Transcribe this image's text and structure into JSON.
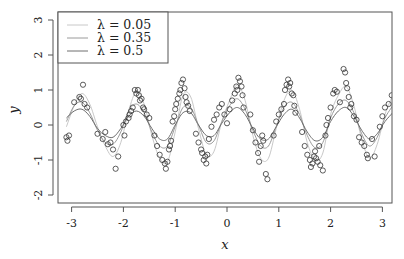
{
  "chart_data": {
    "type": "scatter",
    "title": "",
    "xlabel": "x",
    "ylabel": "y",
    "xlim": [
      -3.25,
      3.2
    ],
    "ylim": [
      -2.2,
      3.2
    ],
    "xticks": [
      -3,
      -2,
      -1,
      0,
      1,
      2,
      3
    ],
    "yticks": [
      -2,
      -1,
      0,
      1,
      2,
      3
    ],
    "grid": false,
    "legend_position": "top-left",
    "legend": [
      {
        "label": "λ = 0.05",
        "color": "#c8c8c8"
      },
      {
        "label": "λ = 0.35",
        "color": "#9a9a9a"
      },
      {
        "label": "λ = 0.5",
        "color": "#6e6e6e"
      }
    ],
    "points": [
      [
        -3.1,
        -0.35
      ],
      [
        -3.08,
        -0.45
      ],
      [
        -3.05,
        -0.3
      ],
      [
        -2.95,
        0.65
      ],
      [
        -2.85,
        0.8
      ],
      [
        -2.82,
        0.75
      ],
      [
        -2.78,
        1.15
      ],
      [
        -2.75,
        0.6
      ],
      [
        -2.7,
        0.5
      ],
      [
        -2.5,
        -0.25
      ],
      [
        -2.4,
        -0.4
      ],
      [
        -2.35,
        -0.2
      ],
      [
        -2.3,
        -0.55
      ],
      [
        -2.25,
        -0.5
      ],
      [
        -2.2,
        -0.7
      ],
      [
        -2.15,
        -1.25
      ],
      [
        -2.1,
        -0.9
      ],
      [
        -2.0,
        0.0
      ],
      [
        -1.98,
        -0.3
      ],
      [
        -1.95,
        0.1
      ],
      [
        -1.9,
        0.2
      ],
      [
        -1.88,
        0.3
      ],
      [
        -1.85,
        0.4
      ],
      [
        -1.82,
        0.5
      ],
      [
        -1.78,
        1.0
      ],
      [
        -1.75,
        0.9
      ],
      [
        -1.72,
        1.0
      ],
      [
        -1.7,
        0.85
      ],
      [
        -1.68,
        0.7
      ],
      [
        -1.65,
        0.75
      ],
      [
        -1.62,
        0.5
      ],
      [
        -1.6,
        0.45
      ],
      [
        -1.55,
        0.3
      ],
      [
        -1.5,
        0.2
      ],
      [
        -1.4,
        -0.3
      ],
      [
        -1.35,
        -0.6
      ],
      [
        -1.3,
        -0.85
      ],
      [
        -1.25,
        -1.0
      ],
      [
        -1.2,
        -1.1
      ],
      [
        -1.18,
        -1.25
      ],
      [
        -1.15,
        -1.05
      ],
      [
        -1.12,
        -0.7
      ],
      [
        -1.1,
        -0.6
      ],
      [
        -1.08,
        -0.45
      ],
      [
        -1.05,
        0.1
      ],
      [
        -1.02,
        0.25
      ],
      [
        -1.0,
        0.45
      ],
      [
        -0.98,
        0.6
      ],
      [
        -0.95,
        0.75
      ],
      [
        -0.92,
        0.9
      ],
      [
        -0.9,
        1.0
      ],
      [
        -0.88,
        1.2
      ],
      [
        -0.85,
        1.3
      ],
      [
        -0.82,
        1.05
      ],
      [
        -0.8,
        0.8
      ],
      [
        -0.78,
        0.65
      ],
      [
        -0.75,
        0.55
      ],
      [
        -0.72,
        0.4
      ],
      [
        -0.6,
        -0.25
      ],
      [
        -0.55,
        -0.5
      ],
      [
        -0.5,
        -0.7
      ],
      [
        -0.48,
        -0.8
      ],
      [
        -0.45,
        -1.0
      ],
      [
        -0.42,
        -0.9
      ],
      [
        -0.4,
        -1.1
      ],
      [
        -0.38,
        -0.85
      ],
      [
        -0.35,
        -0.4
      ],
      [
        -0.3,
        -0.05
      ],
      [
        -0.25,
        0.15
      ],
      [
        -0.2,
        0.3
      ],
      [
        -0.15,
        0.5
      ],
      [
        -0.1,
        0.6
      ],
      [
        -0.05,
        0.3
      ],
      [
        0.0,
        0.05
      ],
      [
        0.05,
        0.45
      ],
      [
        0.1,
        0.7
      ],
      [
        0.15,
        0.9
      ],
      [
        0.18,
        1.1
      ],
      [
        0.2,
        1.0
      ],
      [
        0.22,
        1.35
      ],
      [
        0.25,
        1.25
      ],
      [
        0.28,
        1.1
      ],
      [
        0.3,
        0.85
      ],
      [
        0.32,
        0.5
      ],
      [
        0.45,
        0.3
      ],
      [
        0.5,
        -0.15
      ],
      [
        0.55,
        -0.5
      ],
      [
        0.6,
        -0.8
      ],
      [
        0.62,
        -1.05
      ],
      [
        0.65,
        -0.6
      ],
      [
        0.68,
        -0.3
      ],
      [
        0.7,
        -0.45
      ],
      [
        0.75,
        -1.4
      ],
      [
        0.78,
        -1.55
      ],
      [
        0.9,
        -0.3
      ],
      [
        0.95,
        0.1
      ],
      [
        1.0,
        0.3
      ],
      [
        1.05,
        0.45
      ],
      [
        1.1,
        0.6
      ],
      [
        1.12,
        1.0
      ],
      [
        1.15,
        1.15
      ],
      [
        1.18,
        1.3
      ],
      [
        1.2,
        1.1
      ],
      [
        1.22,
        1.2
      ],
      [
        1.25,
        0.9
      ],
      [
        1.28,
        0.85
      ],
      [
        1.3,
        0.55
      ],
      [
        1.32,
        0.35
      ],
      [
        1.45,
        -0.2
      ],
      [
        1.5,
        -0.6
      ],
      [
        1.55,
        -0.85
      ],
      [
        1.6,
        -1.0
      ],
      [
        1.62,
        -1.2
      ],
      [
        1.65,
        -1.1
      ],
      [
        1.68,
        -0.9
      ],
      [
        1.7,
        -0.75
      ],
      [
        1.72,
        -0.95
      ],
      [
        1.75,
        -1.05
      ],
      [
        1.78,
        -0.6
      ],
      [
        1.8,
        -1.15
      ],
      [
        1.85,
        -1.3
      ],
      [
        1.9,
        -0.3
      ],
      [
        1.92,
        0.0
      ],
      [
        1.95,
        0.2
      ],
      [
        2.0,
        0.5
      ],
      [
        2.05,
        0.9
      ],
      [
        2.08,
        1.0
      ],
      [
        2.12,
        0.95
      ],
      [
        2.18,
        0.65
      ],
      [
        2.25,
        1.6
      ],
      [
        2.28,
        1.5
      ],
      [
        2.3,
        1.2
      ],
      [
        2.32,
        1.05
      ],
      [
        2.35,
        0.8
      ],
      [
        2.38,
        0.5
      ],
      [
        2.4,
        0.6
      ],
      [
        2.45,
        0.25
      ],
      [
        2.5,
        0.15
      ],
      [
        2.55,
        -0.35
      ],
      [
        2.6,
        -0.5
      ],
      [
        2.65,
        -0.6
      ],
      [
        2.7,
        -0.85
      ],
      [
        2.72,
        -0.95
      ],
      [
        2.8,
        -0.4
      ],
      [
        2.85,
        -0.9
      ],
      [
        2.95,
        -0.05
      ],
      [
        3.0,
        0.25
      ],
      [
        3.05,
        0.5
      ],
      [
        3.12,
        0.6
      ],
      [
        3.18,
        0.85
      ]
    ],
    "curves": [
      {
        "name": "λ = 0.05",
        "color": "#c8c8c8",
        "x": [
          -3.1,
          -2.95,
          -2.8,
          -2.65,
          -2.5,
          -2.35,
          -2.2,
          -2.05,
          -1.9,
          -1.75,
          -1.6,
          -1.45,
          -1.3,
          -1.15,
          -1.0,
          -0.85,
          -0.7,
          -0.55,
          -0.4,
          -0.25,
          -0.1,
          0.05,
          0.2,
          0.35,
          0.5,
          0.65,
          0.8,
          0.95,
          1.1,
          1.25,
          1.4,
          1.55,
          1.7,
          1.85,
          2.0,
          2.15,
          2.3,
          2.45,
          2.6,
          2.75,
          2.9,
          3.05,
          3.2
        ],
        "y": [
          -0.05,
          0.55,
          0.9,
          0.6,
          -0.05,
          -0.6,
          -0.9,
          -0.5,
          0.4,
          0.95,
          0.6,
          -0.3,
          -0.95,
          -1.05,
          -0.2,
          0.85,
          0.8,
          -0.1,
          -0.85,
          -0.75,
          0.1,
          0.7,
          1.15,
          0.7,
          -0.3,
          -0.95,
          -0.95,
          -0.1,
          0.7,
          1.0,
          0.45,
          -0.5,
          -1.0,
          -0.8,
          0.3,
          0.85,
          1.1,
          0.55,
          -0.4,
          -0.95,
          -0.55,
          0.3,
          0.85
        ]
      },
      {
        "name": "λ = 0.35",
        "color": "#9a9a9a",
        "x": [
          -3.1,
          -2.95,
          -2.8,
          -2.65,
          -2.5,
          -2.35,
          -2.2,
          -2.05,
          -1.9,
          -1.75,
          -1.6,
          -1.45,
          -1.3,
          -1.15,
          -1.0,
          -0.85,
          -0.7,
          -0.55,
          -0.4,
          -0.25,
          -0.1,
          0.05,
          0.2,
          0.35,
          0.5,
          0.65,
          0.8,
          0.95,
          1.1,
          1.25,
          1.4,
          1.55,
          1.7,
          1.85,
          2.0,
          2.15,
          2.3,
          2.45,
          2.6,
          2.75,
          2.9,
          3.05,
          3.2
        ],
        "y": [
          0.1,
          0.55,
          0.65,
          0.35,
          -0.15,
          -0.5,
          -0.55,
          -0.2,
          0.4,
          0.6,
          0.35,
          -0.2,
          -0.6,
          -0.6,
          -0.05,
          0.5,
          0.5,
          0.0,
          -0.5,
          -0.45,
          0.1,
          0.55,
          0.75,
          0.45,
          -0.15,
          -0.6,
          -0.6,
          -0.05,
          0.5,
          0.65,
          0.3,
          -0.3,
          -0.65,
          -0.5,
          0.2,
          0.6,
          0.7,
          0.35,
          -0.25,
          -0.6,
          -0.35,
          0.2,
          0.55
        ]
      },
      {
        "name": "λ = 0.5",
        "color": "#6e6e6e",
        "x": [
          -3.1,
          -2.95,
          -2.8,
          -2.65,
          -2.5,
          -2.35,
          -2.2,
          -2.05,
          -1.9,
          -1.75,
          -1.6,
          -1.45,
          -1.3,
          -1.15,
          -1.0,
          -0.85,
          -0.7,
          -0.55,
          -0.4,
          -0.25,
          -0.1,
          0.05,
          0.2,
          0.35,
          0.5,
          0.65,
          0.8,
          0.95,
          1.1,
          1.25,
          1.4,
          1.55,
          1.7,
          1.85,
          2.0,
          2.15,
          2.3,
          2.45,
          2.6,
          2.75,
          2.9,
          3.05,
          3.2
        ],
        "y": [
          0.2,
          0.4,
          0.45,
          0.25,
          -0.1,
          -0.3,
          -0.35,
          -0.1,
          0.25,
          0.4,
          0.25,
          -0.1,
          -0.4,
          -0.4,
          0.0,
          0.35,
          0.35,
          0.0,
          -0.3,
          -0.3,
          0.05,
          0.35,
          0.5,
          0.3,
          -0.1,
          -0.4,
          -0.4,
          -0.05,
          0.3,
          0.45,
          0.2,
          -0.2,
          -0.45,
          -0.35,
          0.1,
          0.4,
          0.5,
          0.25,
          -0.15,
          -0.4,
          -0.25,
          0.1,
          0.35
        ]
      }
    ]
  }
}
